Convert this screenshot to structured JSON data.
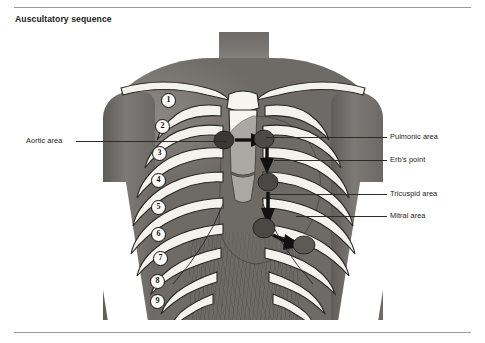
{
  "figure": {
    "title": "Auscultatory sequence",
    "accent_color": "#1a1a1a",
    "rule_color": "#9a9a9a"
  },
  "image": {
    "alt_name": "anterior-chest-photograph-with-rib-and-heart-overlay",
    "subject": "anterior chest",
    "skin_tone": "#7d7a76",
    "bone_color": "#f4f2ec",
    "point_color": "#3a3835"
  },
  "labels": {
    "left": [
      {
        "id": "aortic",
        "text": "Aortic area",
        "x": 26,
        "y": 136,
        "line_from": 76,
        "line_to": 226,
        "line_y": 141
      }
    ],
    "right": [
      {
        "id": "pulmonic",
        "text": "Pulmonic area",
        "x": 390,
        "y": 133,
        "line_from": 266,
        "line_to": 387,
        "line_y": 137
      },
      {
        "id": "erbs",
        "text": "Erb's point",
        "x": 390,
        "y": 156,
        "line_from": 274,
        "line_to": 387,
        "line_y": 160
      },
      {
        "id": "tricuspid",
        "text": "Tricuspid area",
        "x": 390,
        "y": 190,
        "line_from": 268,
        "line_to": 387,
        "line_y": 194
      },
      {
        "id": "mitral",
        "text": "Mitral area",
        "x": 390,
        "y": 212,
        "line_from": 296,
        "line_to": 387,
        "line_y": 216
      }
    ]
  },
  "ribs": {
    "caption": "numbered ribs",
    "numbers": [
      "1",
      "2",
      "3",
      "4",
      "5",
      "6",
      "7",
      "8",
      "9"
    ],
    "positions": [
      {
        "n": "1",
        "x": 168,
        "y": 100
      },
      {
        "n": "2",
        "x": 162,
        "y": 126
      },
      {
        "n": "3",
        "x": 159,
        "y": 153
      },
      {
        "n": "4",
        "x": 158,
        "y": 180
      },
      {
        "n": "5",
        "x": 158,
        "y": 207
      },
      {
        "n": "6",
        "x": 158,
        "y": 234
      },
      {
        "n": "7",
        "x": 160,
        "y": 258
      },
      {
        "n": "8",
        "x": 157,
        "y": 281
      },
      {
        "n": "9",
        "x": 157,
        "y": 301
      }
    ]
  },
  "auscultation_points": [
    {
      "id": "aortic",
      "order": 1,
      "name": "Aortic area",
      "x": 224,
      "y": 140
    },
    {
      "id": "pulmonic",
      "order": 2,
      "name": "Pulmonic area",
      "x": 262,
      "y": 139
    },
    {
      "id": "erbs",
      "order": 3,
      "name": "Erb's point",
      "x": 266,
      "y": 163
    },
    {
      "id": "tricuspid",
      "order": 4,
      "name": "Tricuspid area",
      "x": 262,
      "y": 196
    },
    {
      "id": "mitral",
      "order": 5,
      "name": "Mitral area",
      "x": 296,
      "y": 214
    }
  ]
}
